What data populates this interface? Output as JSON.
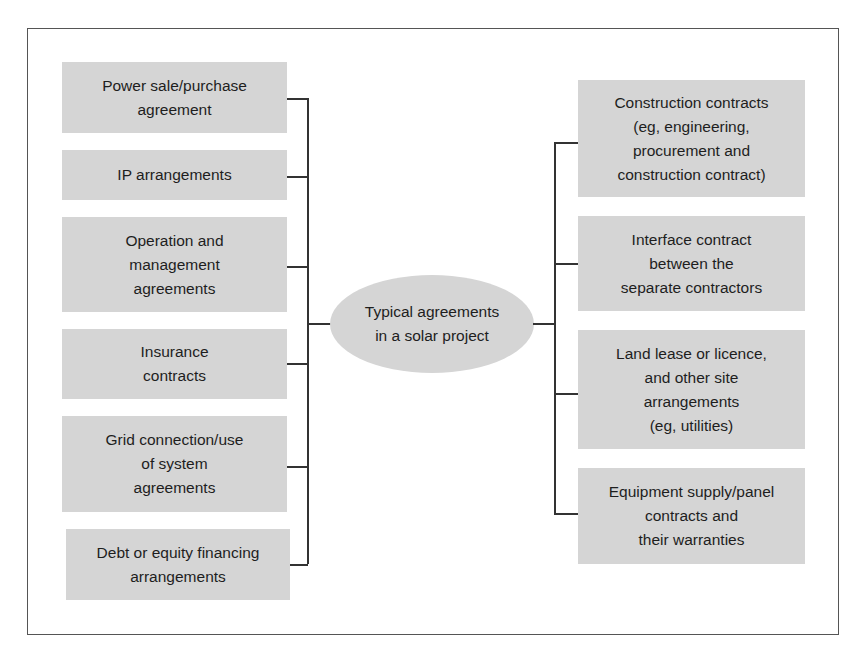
{
  "diagram": {
    "center": {
      "label": "Typical agreements\nin a solar project"
    },
    "left_items": [
      {
        "label": "Power sale/purchase\nagreement"
      },
      {
        "label": "IP arrangements"
      },
      {
        "label": "Operation and\nmanagement\nagreements"
      },
      {
        "label": "Insurance\ncontracts"
      },
      {
        "label": "Grid connection/use\nof system\nagreements"
      },
      {
        "label": "Debt or equity financing\narrangements"
      }
    ],
    "right_items": [
      {
        "label": "Construction contracts\n(eg, engineering,\nprocurement and\nconstruction contract)"
      },
      {
        "label": "Interface contract\nbetween the\nseparate contractors"
      },
      {
        "label": "Land lease or licence,\nand other site\narrangements\n(eg, utilities)"
      },
      {
        "label": "Equipment supply/panel\ncontracts and\ntheir warranties"
      }
    ],
    "colors": {
      "box_fill": "#d5d5d5",
      "line": "#333333",
      "text": "#1e1e1e",
      "frame": "#555555"
    }
  }
}
